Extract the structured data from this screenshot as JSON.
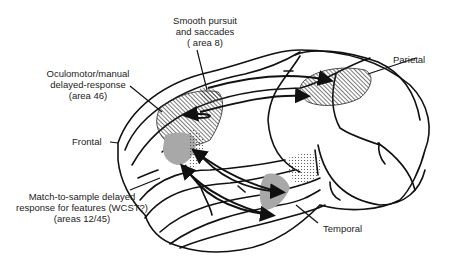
{
  "figure": {
    "lobes": {
      "frontal": "Frontal",
      "parietal": "Parietal",
      "temporal": "Temporal"
    },
    "annotations": [
      {
        "id": "area8",
        "lines": [
          "Smooth pursuit",
          "and saccades",
          "( area 8)"
        ]
      },
      {
        "id": "area46",
        "lines": [
          "Oculomotor/manual",
          "delayed-response",
          "(area 46)"
        ]
      },
      {
        "id": "area12_45",
        "lines": [
          "Match-to-sample delayed",
          "response for features (WCST?)",
          "(areas 12/45)"
        ]
      }
    ],
    "colors": {
      "outline": "#111111",
      "hatch": "#333333",
      "gray_fill": "#a8a8a8",
      "stipple": "#444444",
      "text": "#222222"
    }
  }
}
